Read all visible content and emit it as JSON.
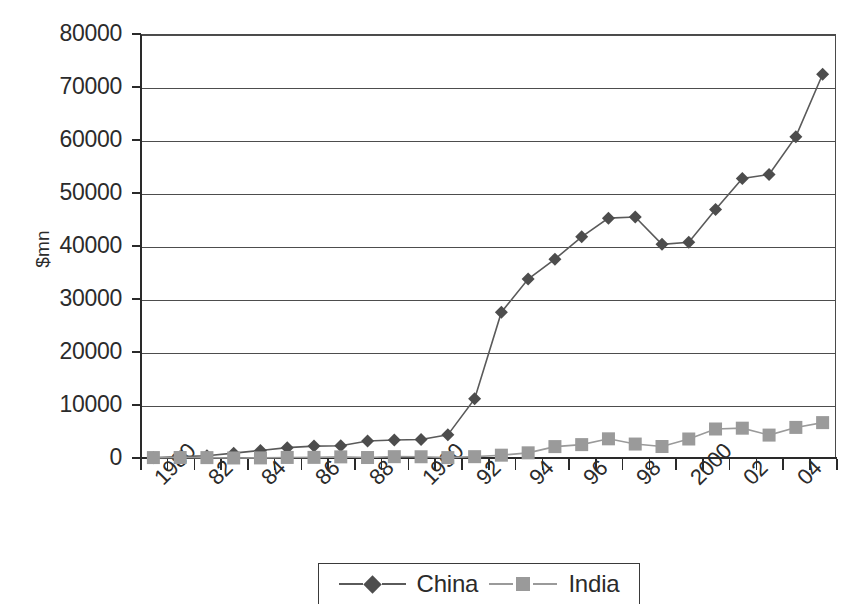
{
  "chart_data": {
    "type": "line",
    "title": "",
    "xlabel": "",
    "ylabel": "$mn",
    "ylim": [
      0,
      80000
    ],
    "ytick_values": [
      0,
      10000,
      20000,
      30000,
      40000,
      50000,
      60000,
      70000,
      80000
    ],
    "ytick_labels": [
      "0",
      "10000",
      "20000",
      "30000",
      "40000",
      "50000",
      "60000",
      "70000",
      "80000"
    ],
    "grid": true,
    "legend_position": "bottom",
    "x": [
      1980,
      1981,
      1982,
      1983,
      1984,
      1985,
      1986,
      1987,
      1988,
      1989,
      1990,
      1991,
      1992,
      1993,
      1994,
      1995,
      1996,
      1997,
      1998,
      1999,
      2000,
      2001,
      2002,
      2003,
      2004,
      2005
    ],
    "xtick_labels": [
      "1980",
      "",
      "82",
      "",
      "84",
      "",
      "86",
      "",
      "88",
      "",
      "1990",
      "",
      "92",
      "",
      "94",
      "",
      "96",
      "",
      "98",
      "",
      "2000",
      "",
      "02",
      "",
      "04",
      ""
    ],
    "xtick_labels_shown": [
      "1980",
      "82",
      "84",
      "86",
      "88",
      "1990",
      "92",
      "94",
      "96",
      "98",
      "2000",
      "02",
      "04"
    ],
    "series": [
      {
        "name": "China",
        "marker": "diamond",
        "color": "#4d4d4d",
        "values": [
          57,
          265,
          430,
          916,
          1419,
          1956,
          2244,
          2314,
          3194,
          3393,
          3487,
          4366,
          11156,
          27515,
          33767,
          37521,
          41726,
          45257,
          45463,
          40319,
          40715,
          46878,
          52743,
          53505,
          60630,
          72406
        ]
      },
      {
        "name": "India",
        "marker": "square",
        "color": "#9a9a9a",
        "values": [
          79,
          92,
          72,
          6,
          19,
          106,
          118,
          212,
          91,
          252,
          237,
          75,
          252,
          532,
          974,
          2151,
          2525,
          3619,
          2633,
          2168,
          3585,
          5472,
          5627,
          4323,
          5771,
          6676
        ]
      }
    ]
  },
  "axes": {
    "y_axis_title": "$mn"
  },
  "legend": {
    "entries": [
      {
        "label": "China",
        "marker": "diamond-icon",
        "color": "#4d4d4d"
      },
      {
        "label": "India",
        "marker": "square-icon",
        "color": "#9a9a9a"
      }
    ]
  }
}
